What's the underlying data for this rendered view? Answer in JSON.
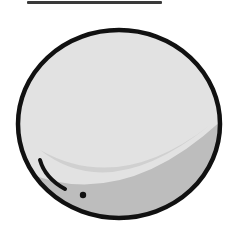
{
  "illustration": {
    "subject": "gray-disc",
    "colors": {
      "fill": "#e2e2e2",
      "shadow": "#bdbdbd",
      "outline": "#111111",
      "top_line": "#3a3a3a",
      "background": "#ffffff"
    }
  }
}
